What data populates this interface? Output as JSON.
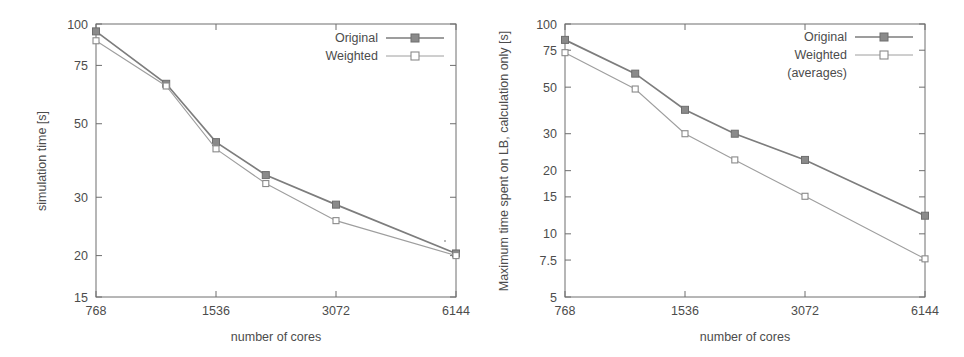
{
  "figure": {
    "background_color": "#ffffff",
    "line_color": "#7d7d7d",
    "text_color": "#4c4c4c",
    "axis_color": "#6e6e6e"
  },
  "panels": [
    {
      "id": "left",
      "chart_data": {
        "type": "line",
        "title": "",
        "xlabel": "number of cores",
        "ylabel": "simulation time [s]",
        "xscale": "log",
        "yscale": "log",
        "xlim": [
          768,
          6144
        ],
        "ylim": [
          15,
          100
        ],
        "grid": false,
        "legend_position": "top-right",
        "xticks": [
          768,
          1536,
          3072,
          6144
        ],
        "xtick_labels": [
          "768",
          "1536",
          "3072",
          "6144"
        ],
        "yticks": [
          15,
          20,
          30,
          50,
          75,
          100
        ],
        "ytick_labels": [
          "15",
          "20",
          "30",
          "50",
          "75",
          "100"
        ],
        "x": [
          768,
          1152,
          1536,
          2048,
          3072,
          6144
        ],
        "series": [
          {
            "name": "Original",
            "marker": "filled-square",
            "values": [
              95,
              66,
              44,
              35,
              28.5,
              20.3
            ]
          },
          {
            "name": "Weighted",
            "marker": "open-square",
            "values": [
              89,
              65,
              42,
              33,
              25.5,
              20
            ]
          }
        ]
      },
      "legend": [
        {
          "label": "Original",
          "marker": "filled-square"
        },
        {
          "label": "Weighted",
          "marker": "open-square"
        }
      ]
    },
    {
      "id": "right",
      "chart_data": {
        "type": "line",
        "title": "",
        "xlabel": "number of cores",
        "ylabel": "Maximum time spent on LB, calculation only [s]",
        "xscale": "log",
        "yscale": "log",
        "xlim": [
          768,
          6144
        ],
        "ylim": [
          5,
          100
        ],
        "grid": false,
        "legend_position": "top-right",
        "xticks": [
          768,
          1536,
          3072,
          6144
        ],
        "xtick_labels": [
          "768",
          "1536",
          "3072",
          "6144"
        ],
        "yticks": [
          5,
          7.5,
          10,
          15,
          20,
          30,
          50,
          75,
          100
        ],
        "ytick_labels": [
          "5",
          "7.5",
          "10",
          "15",
          "20",
          "30",
          "50",
          "75",
          "100"
        ],
        "x": [
          768,
          1152,
          1536,
          2048,
          3072,
          6144
        ],
        "series": [
          {
            "name": "Original",
            "marker": "filled-square",
            "values": [
              84,
              58,
              39,
              30,
              22.5,
              12.2
            ]
          },
          {
            "name": "Weighted (averages)",
            "marker": "open-square",
            "values": [
              73,
              49,
              30,
              22.5,
              15.1,
              7.6
            ]
          }
        ]
      },
      "legend": [
        {
          "label": "Original",
          "marker": "filled-square"
        },
        {
          "label": "Weighted",
          "marker": "open-square"
        },
        {
          "label": "(averages)",
          "marker": "none"
        }
      ]
    }
  ]
}
